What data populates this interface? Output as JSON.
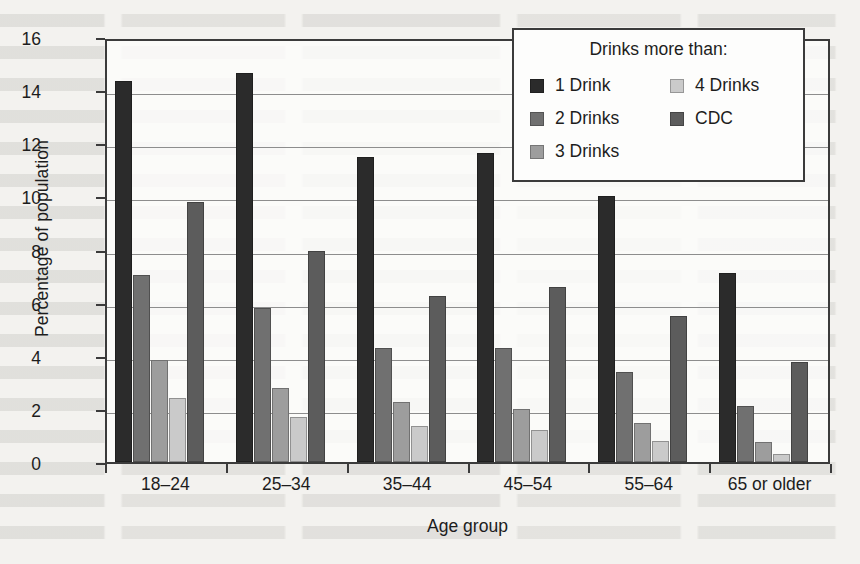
{
  "chart_data": {
    "type": "bar",
    "title": "",
    "xlabel": "Age group",
    "ylabel": "Percentage of population",
    "ylim": [
      0,
      16
    ],
    "yticks": [
      0,
      2,
      4,
      6,
      8,
      10,
      12,
      14,
      16
    ],
    "grid": true,
    "legend_position": "top-right-inside",
    "legend_title": "Drinks more than:",
    "categories": [
      "18–24",
      "25–34",
      "35–44",
      "45–54",
      "55–64",
      "65 or older"
    ],
    "series": [
      {
        "name": "1 Drink",
        "color": "#2b2b2b",
        "values": [
          14.35,
          14.65,
          11.5,
          11.65,
          10.0,
          7.1
        ]
      },
      {
        "name": "2 Drinks",
        "color": "#707070",
        "values": [
          7.05,
          5.8,
          4.3,
          4.3,
          3.4,
          2.1
        ]
      },
      {
        "name": "3 Drinks",
        "color": "#9d9d9d",
        "values": [
          3.85,
          2.8,
          2.25,
          2.0,
          1.45,
          0.75
        ]
      },
      {
        "name": "4 Drinks",
        "color": "#cacaca",
        "values": [
          2.4,
          1.7,
          1.35,
          1.2,
          0.8,
          0.3
        ]
      },
      {
        "name": "CDC",
        "color": "#5c5c5c",
        "values": [
          9.8,
          7.95,
          6.25,
          6.6,
          5.5,
          3.75
        ]
      }
    ]
  },
  "legend": {
    "title": "Drinks more than:",
    "left_column": [
      "1 Drink",
      "2 Drinks",
      "3 Drinks"
    ],
    "right_column": [
      "4 Drinks",
      "CDC"
    ]
  },
  "axes": {
    "y_title": "Percentage of population",
    "x_title": "Age group",
    "y_tick_labels": [
      "0",
      "2",
      "4",
      "6",
      "8",
      "10",
      "12",
      "14",
      "16"
    ],
    "x_tick_labels": [
      "18–24",
      "25–34",
      "35–44",
      "45–54",
      "55–64",
      "65 or older"
    ]
  },
  "colors": {
    "axis": "#3b3b3b",
    "grid": "#8d8d8d",
    "page_background": "#f3f2ef",
    "plot_background": "#fcfcfb"
  }
}
